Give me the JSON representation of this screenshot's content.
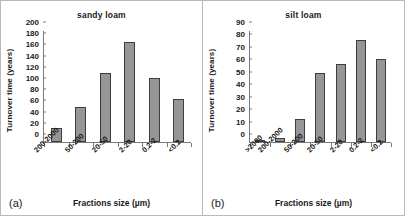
{
  "figure": {
    "panels": [
      {
        "tag": "(a)",
        "title": "sandy loam",
        "xlabel": "Fractions size (µm)",
        "ylabel": "Turnover time (years)"
      },
      {
        "tag": "(b)",
        "title": "silt loam",
        "xlabel": "Fractions size (µm)",
        "ylabel": "Turnover time (years)"
      }
    ],
    "bar_color": "#969696",
    "bar_edge_color": "#3d3d3d",
    "frame_color": "#b9b9b9"
  },
  "chart_data": [
    {
      "type": "bar",
      "title": "sandy loam",
      "xlabel": "Fractions size (µm)",
      "ylabel": "Turnover time (years)",
      "categories": [
        "200-2000",
        "50-200",
        "20-50",
        "2-20",
        "0.2-2",
        "<0.2"
      ],
      "values": [
        25,
        63,
        124,
        180,
        115,
        77
      ],
      "ylim": [
        0,
        200
      ],
      "yticks": [
        0,
        20,
        40,
        60,
        80,
        100,
        120,
        140,
        160,
        180,
        200
      ],
      "grid": false,
      "legend": "none"
    },
    {
      "type": "bar",
      "title": "silt loam",
      "xlabel": "Fractions size (µm)",
      "ylabel": "Turnover time (years)",
      "categories": [
        ">2000",
        "200-2000",
        "50-200",
        "20-50",
        "2-20",
        "0.2-2",
        "<0.2"
      ],
      "values": [
        0.5,
        3,
        19,
        56,
        63,
        83,
        67
      ],
      "ylim": [
        0,
        90
      ],
      "yticks": [
        0,
        10,
        20,
        30,
        40,
        50,
        60,
        70,
        80,
        90
      ],
      "grid": false,
      "legend": "none"
    }
  ]
}
